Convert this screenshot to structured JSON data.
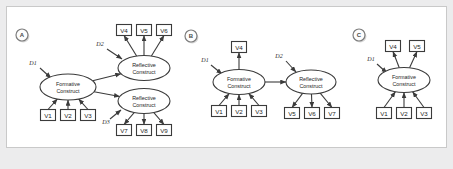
{
  "figure": {
    "background": "#ececed",
    "panel_background": "#ffffff",
    "stroke_color": "#3b3b3b",
    "frame_border": "#c9c9c9",
    "construct_labels": {
      "formative_line1": "Formative",
      "formative_line2": "Construct",
      "reflective_line1": "Reflective",
      "reflective_line2": "Construct"
    }
  },
  "panels": [
    {
      "id": "A",
      "badge": "A",
      "constructs": [
        {
          "name": "formative-construct",
          "kind": "formative",
          "label1": "Formative",
          "label2": "Construct",
          "cx": 68,
          "cy": 87,
          "rx": 28,
          "ry": 13
        },
        {
          "name": "reflective-construct-top",
          "kind": "reflective",
          "label1": "Reflective",
          "label2": "Construct",
          "cx": 144,
          "cy": 68,
          "rx": 26,
          "ry": 12.5
        },
        {
          "name": "reflective-construct-bottom",
          "kind": "reflective",
          "label1": "Reflective",
          "label2": "Construct",
          "cx": 144,
          "cy": 101,
          "rx": 26,
          "ry": 12.5
        }
      ],
      "indicators": [
        {
          "label": "V1",
          "x": 48,
          "y": 115,
          "role": "formative-input"
        },
        {
          "label": "V2",
          "x": 68,
          "y": 115,
          "role": "formative-input"
        },
        {
          "label": "V3",
          "x": 88,
          "y": 115,
          "role": "formative-input"
        },
        {
          "label": "V4",
          "x": 124,
          "y": 30,
          "role": "reflective-output"
        },
        {
          "label": "V5",
          "x": 144,
          "y": 30,
          "role": "reflective-output"
        },
        {
          "label": "V6",
          "x": 164,
          "y": 30,
          "role": "reflective-output"
        },
        {
          "label": "V7",
          "x": 124,
          "y": 130,
          "role": "reflective-output"
        },
        {
          "label": "V8",
          "x": 144,
          "y": 130,
          "role": "reflective-output"
        },
        {
          "label": "V9",
          "x": 164,
          "y": 130,
          "role": "reflective-output"
        }
      ],
      "disturbances": [
        {
          "label": "D1",
          "tx": 33,
          "ty": 65,
          "x1": 40,
          "y1": 68,
          "x2": 51,
          "y2": 78
        },
        {
          "label": "D2",
          "tx": 100,
          "ty": 46,
          "x1": 107,
          "y1": 49,
          "x2": 122,
          "y2": 59
        },
        {
          "label": "D3",
          "tx": 106,
          "ty": 124,
          "x1": 110,
          "y1": 119,
          "x2": 121,
          "y2": 110
        }
      ],
      "paths": [
        {
          "from": "formative-construct",
          "to": "reflective-construct-top"
        },
        {
          "from": "formative-construct",
          "to": "reflective-construct-bottom"
        }
      ]
    },
    {
      "id": "B",
      "badge": "B",
      "constructs": [
        {
          "name": "formative-construct",
          "kind": "formative",
          "label1": "Formative",
          "label2": "Construct",
          "cx": 239,
          "cy": 82,
          "rx": 26,
          "ry": 12.5
        },
        {
          "name": "reflective-construct",
          "kind": "reflective",
          "label1": "Reflective",
          "label2": "Construct",
          "cx": 311,
          "cy": 82,
          "rx": 25,
          "ry": 12
        },
        {
          "name": "",
          "kind": "",
          "label1": "",
          "label2": "",
          "cx": 0,
          "cy": 0,
          "rx": 0,
          "ry": 0
        }
      ],
      "indicators": [
        {
          "label": "V1",
          "x": 219,
          "y": 111,
          "role": "formative-input"
        },
        {
          "label": "V2",
          "x": 239,
          "y": 111,
          "role": "formative-input"
        },
        {
          "label": "V3",
          "x": 259,
          "y": 111,
          "role": "formative-input"
        },
        {
          "label": "V4",
          "x": 239,
          "y": 47,
          "role": "formative-output"
        },
        {
          "label": "V5",
          "x": 292,
          "y": 113,
          "role": "reflective-output"
        },
        {
          "label": "V6",
          "x": 312,
          "y": 113,
          "role": "reflective-output"
        },
        {
          "label": "V7",
          "x": 332,
          "y": 113,
          "role": "reflective-output"
        }
      ],
      "disturbances": [
        {
          "label": "D1",
          "tx": 205,
          "ty": 62,
          "x1": 211,
          "y1": 65,
          "x2": 222,
          "y2": 74
        },
        {
          "label": "D2",
          "tx": 279,
          "ty": 58,
          "x1": 286,
          "y1": 61,
          "x2": 296,
          "y2": 72
        }
      ],
      "paths": [
        {
          "from": "formative-construct",
          "to": "reflective-construct"
        }
      ]
    },
    {
      "id": "C",
      "badge": "C",
      "constructs": [
        {
          "name": "formative-construct",
          "kind": "formative",
          "label1": "Formative",
          "label2": "Construct",
          "cx": 404,
          "cy": 80,
          "rx": 26,
          "ry": 12.5
        },
        {
          "name": "",
          "kind": "",
          "label1": "",
          "label2": "",
          "cx": 0,
          "cy": 0,
          "rx": 0,
          "ry": 0
        },
        {
          "name": "",
          "kind": "",
          "label1": "",
          "label2": "",
          "cx": 0,
          "cy": 0,
          "rx": 0,
          "ry": 0
        }
      ],
      "indicators": [
        {
          "label": "V1",
          "x": 384,
          "y": 113,
          "role": "formative-input"
        },
        {
          "label": "V2",
          "x": 404,
          "y": 113,
          "role": "formative-input"
        },
        {
          "label": "V3",
          "x": 424,
          "y": 113,
          "role": "formative-input"
        },
        {
          "label": "V4",
          "x": 393,
          "y": 46,
          "role": "formative-output"
        },
        {
          "label": "V5",
          "x": 417,
          "y": 46,
          "role": "formative-output"
        }
      ],
      "disturbances": [
        {
          "label": "D1",
          "tx": 371,
          "ty": 61,
          "x1": 377,
          "y1": 64,
          "x2": 387,
          "y2": 73
        }
      ],
      "paths": []
    }
  ],
  "badges": [
    {
      "label": "A",
      "cx": 22,
      "cy": 35
    },
    {
      "label": "B",
      "cx": 191,
      "cy": 36
    },
    {
      "label": "C",
      "cx": 359,
      "cy": 35
    }
  ]
}
